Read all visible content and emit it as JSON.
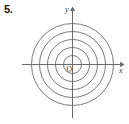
{
  "figure": {
    "problem_number": "5.",
    "origin_label": "O",
    "axis_x_label": "x",
    "axis_y_label": "y",
    "line_color": "#6b6b6b",
    "axis_color": "#6b6b6b",
    "text_color": "#3a3a3a",
    "background": "#ffffff"
  },
  "chart_data": {
    "type": "scatter",
    "title": "",
    "xlabel": "x",
    "ylabel": "y",
    "grid": false,
    "legend": null,
    "center": {
      "x": 0,
      "y": 0
    },
    "circle_radii": [
      9,
      17,
      25,
      33,
      41
    ],
    "circle_count": 5,
    "xlim": [
      -50,
      50
    ],
    "ylim": [
      -56,
      56
    ],
    "annotations": [
      {
        "text": "O",
        "x": -4,
        "y": -6
      },
      {
        "text": "x",
        "x": 49,
        "y": -6
      },
      {
        "text": "y",
        "x": -6,
        "y": 55
      }
    ]
  }
}
